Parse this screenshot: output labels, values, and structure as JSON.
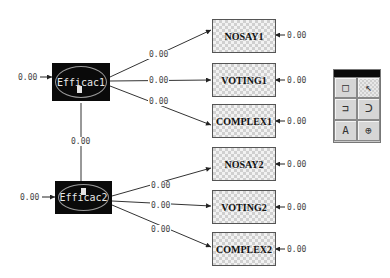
{
  "latents": [
    {
      "id": "Efficac1",
      "label": "Efficac1",
      "variance": "0.00"
    },
    {
      "id": "Efficac2",
      "label": "Efficac2",
      "variance": "0.00"
    }
  ],
  "covariance": {
    "from": "Efficac1",
    "to": "Efficac2",
    "value": "0.00"
  },
  "indicators": [
    {
      "label": "NOSAY1",
      "loading": "0.00",
      "error": "0.00",
      "factor": "Efficac1"
    },
    {
      "label": "VOTING1",
      "loading": "0.00",
      "error": "0.00",
      "factor": "Efficac1"
    },
    {
      "label": "COMPLEX1",
      "loading": "0.00",
      "error": "0.00",
      "factor": "Efficac1"
    },
    {
      "label": "NOSAY2",
      "loading": "0.00",
      "error": "0.00",
      "factor": "Efficac2"
    },
    {
      "label": "VOTING2",
      "loading": "0.00",
      "error": "0.00",
      "factor": "Efficac2"
    },
    {
      "label": "COMPLEX2",
      "loading": "0.00",
      "error": "0.00",
      "factor": "Efficac2"
    }
  ],
  "toolbar": {
    "tools": [
      {
        "name": "rectangle-tool",
        "glyph": "□"
      },
      {
        "name": "arrow-tool",
        "glyph": "↖"
      },
      {
        "name": "path-tool",
        "glyph": "⊐"
      },
      {
        "name": "curve-tool",
        "glyph": "Ↄ"
      },
      {
        "name": "text-tool",
        "glyph": "A"
      },
      {
        "name": "zoom-tool",
        "glyph": "⊕"
      }
    ]
  },
  "colors": {
    "latent_fill": "#0a0a0a",
    "indicator_fill": "#d0d0d0",
    "line": "#333333",
    "text": "#444444"
  }
}
